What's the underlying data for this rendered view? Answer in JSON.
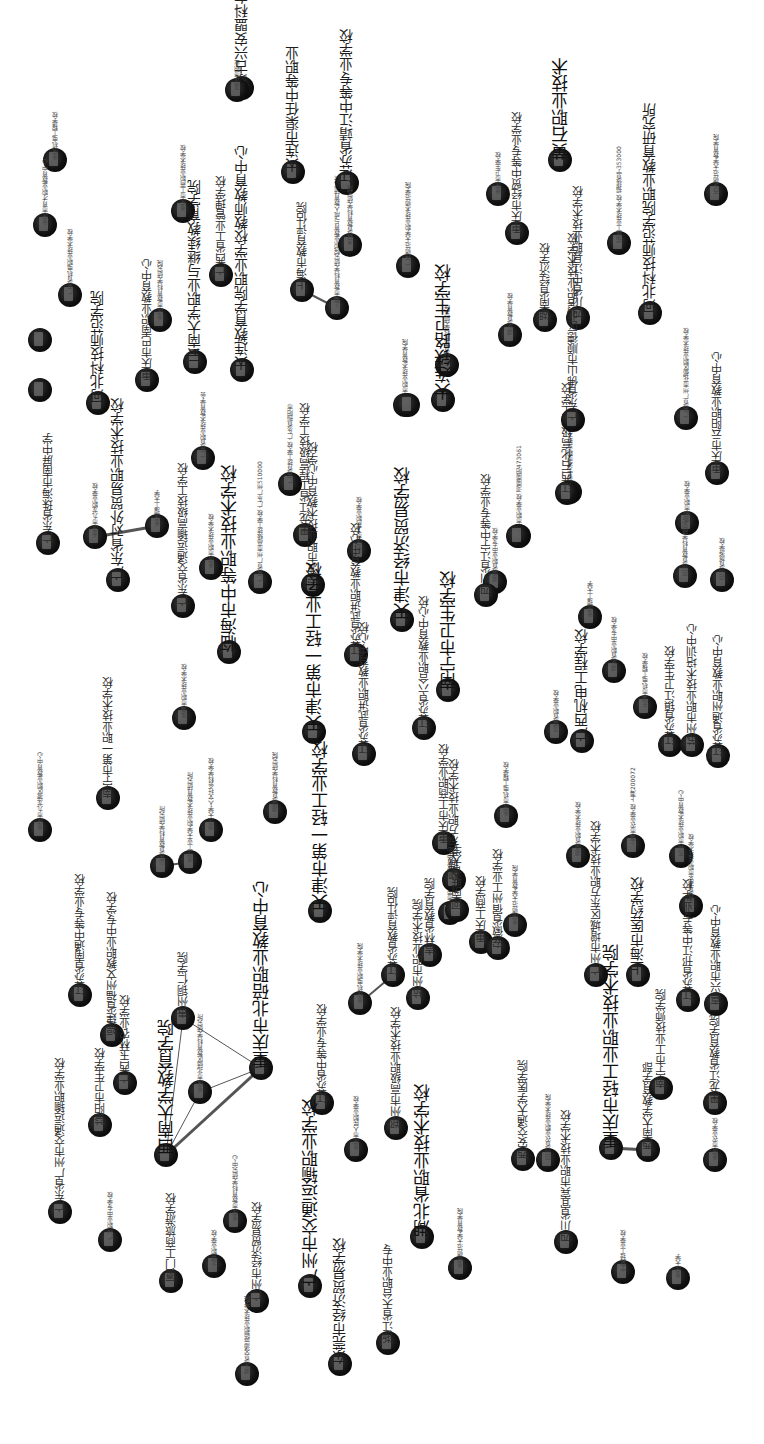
{
  "diagram": {
    "type": "network-graph",
    "orientation": "rotated-90",
    "node_color": "#111111",
    "edge_color": "#555555",
    "background": "#ffffff"
  },
  "nodes": [
    {
      "id": "n1",
      "x": 55,
      "y": 160,
      "label": "重庆机电工程学校",
      "size": "s"
    },
    {
      "id": "n2",
      "x": 45,
      "y": 225,
      "label": "重庆市育才职业教育中心",
      "size": "s"
    },
    {
      "id": "n3",
      "x": 70,
      "y": 295,
      "label": "广东省机电职业技术学校",
      "size": "s"
    },
    {
      "id": "n4",
      "x": 40,
      "y": 340,
      "label": "",
      "size": "s"
    },
    {
      "id": "n5",
      "x": 40,
      "y": 390,
      "label": "",
      "size": "s"
    },
    {
      "id": "n6",
      "x": 98,
      "y": 403,
      "label": "河北科技师范学院",
      "size": "l"
    },
    {
      "id": "n7",
      "x": 147,
      "y": 380,
      "label": "重庆市巴南职业教育中心",
      "size": "m"
    },
    {
      "id": "n8",
      "x": 160,
      "y": 320,
      "label": "重庆市教育科学研究院",
      "size": "s"
    },
    {
      "id": "n9",
      "x": 183,
      "y": 211,
      "label": "重庆市工商职业技术学校",
      "size": "s"
    },
    {
      "id": "n10",
      "x": 195,
      "y": 362,
      "label": "云南大学职业与继续教育学院",
      "size": "l"
    },
    {
      "id": "n11",
      "x": 221,
      "y": 275,
      "label": "广西省工业管理学校",
      "size": "m"
    },
    {
      "id": "n12",
      "x": 242,
      "y": 88,
      "label": "蒙古兴安盟科右前旗民族职业高中",
      "size": "l"
    },
    {
      "id": "n13",
      "x": 242,
      "y": 370,
      "label": "大连教育学院职业学校教师教育中心",
      "size": "l"
    },
    {
      "id": "n14",
      "x": 237,
      "y": 90,
      "label": "湛江市职业",
      "size": "s"
    },
    {
      "id": "n15",
      "x": 293,
      "y": 172,
      "label": "大连市渠任中等职业",
      "size": "l"
    },
    {
      "id": "n16",
      "x": 302,
      "y": 290,
      "label": "上海市教育评估院",
      "size": "m"
    },
    {
      "id": "n17",
      "x": 337,
      "y": 308,
      "label": "上海市教育科学研究院职业教育与成人教育研究所",
      "size": "s"
    },
    {
      "id": "n18",
      "x": 347,
      "y": 183,
      "label": "江苏省靖江中等专业学校",
      "size": "l"
    },
    {
      "id": "n19",
      "x": 350,
      "y": 245,
      "label": "吉林省教育科学研究院",
      "size": "s"
    },
    {
      "id": "n20",
      "x": 408,
      "y": 266,
      "label": "广西师范大学职业技术师范学院",
      "size": "s"
    },
    {
      "id": "n21",
      "x": 498,
      "y": 194,
      "label": "重庆市卫生学校",
      "size": "s"
    },
    {
      "id": "n22",
      "x": 517,
      "y": 233,
      "label": "重庆市经贸中等专业学校",
      "size": "m"
    },
    {
      "id": "n23",
      "x": 560,
      "y": 160,
      "label": "黄石职业技术",
      "size": "xl"
    },
    {
      "id": "n24",
      "x": 619,
      "y": 243,
      "label": "福建工业技术学校 福建省宁353000",
      "size": "s"
    },
    {
      "id": "n25",
      "x": 716,
      "y": 194,
      "label": "西北师范大学教育学院",
      "size": "s"
    },
    {
      "id": "n26",
      "x": 650,
      "y": 313,
      "label": "河北科技师范学院职业教育研究所",
      "size": "l"
    },
    {
      "id": "n27",
      "x": 510,
      "y": 335,
      "label": "湖北省教育学校",
      "size": "s"
    },
    {
      "id": "n28",
      "x": 545,
      "y": 320,
      "label": "湖南省经济学校",
      "size": "m"
    },
    {
      "id": "n29",
      "x": 578,
      "y": 318,
      "label": "四川省中江县职业技术学校",
      "size": "m"
    },
    {
      "id": "n30",
      "x": 447,
      "y": 365,
      "label": "吉林省教育科学研究院",
      "size": "s"
    },
    {
      "id": "n31",
      "x": 443,
      "y": 400,
      "label": "大连铁路卫生学校",
      "size": "xl"
    },
    {
      "id": "n32",
      "x": 405,
      "y": 405,
      "label": "重庆市职业技术教育学院",
      "size": "s"
    },
    {
      "id": "n33",
      "x": 48,
      "y": 543,
      "label": "广东省珠海市南屏中学",
      "size": "m"
    },
    {
      "id": "n34",
      "x": 95,
      "y": 537,
      "label": "重庆市九龙职业学校",
      "size": "s"
    },
    {
      "id": "n35",
      "x": 157,
      "y": 526,
      "label": "重庆理工大学",
      "size": "s"
    },
    {
      "id": "n36",
      "x": 118,
      "y": 580,
      "label": "广东省对外贸易职业技术学校",
      "size": "l"
    },
    {
      "id": "n37",
      "x": 183,
      "y": 606,
      "label": "广东省交通运输高级技工学校",
      "size": "m"
    },
    {
      "id": "n38",
      "x": 203,
      "y": 458,
      "label": "广东省职业技术教育学会",
      "size": "s"
    },
    {
      "id": "n39",
      "x": 211,
      "y": 568,
      "label": "重庆市职业技术学校",
      "size": "s"
    },
    {
      "id": "n40",
      "x": 229,
      "y": 652,
      "label": "临海市中等职业技术学校",
      "size": "xl"
    },
    {
      "id": "n41",
      "x": 260,
      "y": 582,
      "label": "广东省广州市高级技工学校 广东广州510000",
      "size": "s"
    },
    {
      "id": "n42",
      "x": 290,
      "y": 484,
      "label": "广东省技工学校 广东省揭阳市",
      "size": "s"
    },
    {
      "id": "n43",
      "x": 305,
      "y": 535,
      "label": "黑龙江省工程高级技工学校",
      "size": "m"
    },
    {
      "id": "n44",
      "x": 313,
      "y": 585,
      "label": "宁波市职业技术教育中心学校",
      "size": "m"
    },
    {
      "id": "n45",
      "x": 359,
      "y": 551,
      "label": "重庆市工商职业学校",
      "size": "s"
    },
    {
      "id": "n46",
      "x": 356,
      "y": 655,
      "label": "江苏省武进职业教育中心校",
      "size": "m"
    },
    {
      "id": "n47",
      "x": 402,
      "y": 620,
      "label": "天津市经济贸易学校",
      "size": "xl"
    },
    {
      "id": "n48",
      "x": 408,
      "y": 405,
      "label": "",
      "size": "s"
    },
    {
      "id": "n49",
      "x": 519,
      "y": 536,
      "label": "南宁市职业学校 河南南阳473061",
      "size": "s"
    },
    {
      "id": "n50",
      "x": 518,
      "y": 536,
      "label": "",
      "size": "s"
    },
    {
      "id": "n51",
      "x": 495,
      "y": 582,
      "label": "湖南省职业中专学校",
      "size": "s"
    },
    {
      "id": "n52",
      "x": 570,
      "y": 492,
      "label": "浙江省宁波市职业技术教育中心",
      "size": "s"
    },
    {
      "id": "n53",
      "x": 567,
      "y": 493,
      "label": "江西石化高级技工学校",
      "size": "m"
    },
    {
      "id": "n54",
      "x": 573,
      "y": 420,
      "label": "广东省佛山市顺德区北滘职业技术学校",
      "size": "m"
    },
    {
      "id": "n55",
      "x": 687,
      "y": 523,
      "label": "成都市职业学校",
      "size": "s"
    },
    {
      "id": "n56",
      "x": 685,
      "y": 576,
      "label": "四川省教育科学研究所",
      "size": "s"
    },
    {
      "id": "n57",
      "x": 686,
      "y": 418,
      "label": "广东省广州市花都区职业技术学校",
      "size": "s"
    },
    {
      "id": "n58",
      "x": 717,
      "y": 473,
      "label": "重庆市云阳职业教育中心",
      "size": "m"
    },
    {
      "id": "n59",
      "x": 722,
      "y": 580,
      "label": "四川省旅游学校",
      "size": "s"
    },
    {
      "id": "n60",
      "x": 486,
      "y": 595,
      "label": "四川省江宁中等专业学校",
      "size": "m"
    },
    {
      "id": "n61",
      "x": 448,
      "y": 690,
      "label": "南宁市卫生学校",
      "size": "xl"
    },
    {
      "id": "n62",
      "x": 424,
      "y": 728,
      "label": "江苏省六合职业教育中心校",
      "size": "m"
    },
    {
      "id": "n63",
      "x": 590,
      "y": 617,
      "label": "重庆理工大学",
      "size": "s"
    },
    {
      "id": "n64",
      "x": 614,
      "y": 671,
      "label": "湖北省职业中专学校",
      "size": "s"
    },
    {
      "id": "n65",
      "x": 645,
      "y": 707,
      "label": "天津市机电工程学校",
      "size": "s"
    },
    {
      "id": "n66",
      "x": 556,
      "y": 732,
      "label": "河南省职业学校",
      "size": "s"
    },
    {
      "id": "n67",
      "x": 582,
      "y": 741,
      "label": "广西机电工程学校",
      "size": "l"
    },
    {
      "id": "n68",
      "x": 670,
      "y": 745,
      "label": "江苏省镇江卫生学校",
      "size": "m"
    },
    {
      "id": "n69",
      "x": 692,
      "y": 745,
      "label": "苏州市职业技术培训中心",
      "size": "m"
    },
    {
      "id": "n70",
      "x": 718,
      "y": 756,
      "label": "江苏省通州职业教育中心",
      "size": "m"
    },
    {
      "id": "n71",
      "x": 40,
      "y": 830,
      "label": "重庆市九龙坡区职业教育中心",
      "size": "s"
    },
    {
      "id": "n72",
      "x": 108,
      "y": 798,
      "label": "南宁市第一职业技术学校",
      "size": "m"
    },
    {
      "id": "n73",
      "x": 184,
      "y": 718,
      "label": "珠海市职业技术学校",
      "size": "s"
    },
    {
      "id": "n74",
      "x": 211,
      "y": 830,
      "label": "浙江大学人文社会科学学校",
      "size": "s"
    },
    {
      "id": "n75",
      "x": 162,
      "y": 866,
      "label": "山东省教育科学研究所",
      "size": "s"
    },
    {
      "id": "n76",
      "x": 190,
      "y": 862,
      "label": "浙江工业大学职业技术教育研究所",
      "size": "s"
    },
    {
      "id": "n77",
      "x": 275,
      "y": 812,
      "label": "湖南省教育科学研究院",
      "size": "s"
    },
    {
      "id": "n78",
      "x": 314,
      "y": 732,
      "label": "天津市第一轻工业学校",
      "size": "xl"
    },
    {
      "id": "n79",
      "x": 364,
      "y": 754,
      "label": "江苏省武进职业教育中心校",
      "size": "m"
    },
    {
      "id": "n80",
      "x": 444,
      "y": 843,
      "label": "重庆市工商职业学校",
      "size": "m"
    },
    {
      "id": "n81",
      "x": 506,
      "y": 816,
      "label": "重庆市机电工程学校",
      "size": "s"
    },
    {
      "id": "n82",
      "x": 578,
      "y": 856,
      "label": "湖南省职业技术学校",
      "size": "s"
    },
    {
      "id": "n83",
      "x": 633,
      "y": 846,
      "label": "上海市农业学校 上海200072",
      "size": "s"
    },
    {
      "id": "n84",
      "x": 681,
      "y": 856,
      "label": "苏州市职业技术教育中心",
      "size": "s"
    },
    {
      "id": "n85",
      "x": 691,
      "y": 906,
      "label": "江苏省淮安市职业技术学校",
      "size": "s"
    },
    {
      "id": "n86",
      "x": 80,
      "y": 995,
      "label": "江苏省南通中等专业学校",
      "size": "m"
    },
    {
      "id": "n87",
      "x": 112,
      "y": 1035,
      "label": "福建省福州文教职业中专学校",
      "size": "m"
    },
    {
      "id": "n88",
      "x": 183,
      "y": 1018,
      "label": "贵州铜仁学院",
      "size": "m"
    },
    {
      "id": "n89",
      "x": 261,
      "y": 1068,
      "label": "重庆市北碚职业教育中心",
      "size": "xl"
    },
    {
      "id": "n90",
      "x": 320,
      "y": 911,
      "label": "天津市第一轻工业学校",
      "size": "xl"
    },
    {
      "id": "n91",
      "x": 360,
      "y": 1003,
      "label": "重庆机电职业技术学院",
      "size": "s"
    },
    {
      "id": "n92",
      "x": 393,
      "y": 975,
      "label": "江苏省教育评估院",
      "size": "m"
    },
    {
      "id": "n93",
      "x": 450,
      "y": 913,
      "label": "重庆市荣昌职业教育中心",
      "size": "s"
    },
    {
      "id": "n94",
      "x": 454,
      "y": 880,
      "label": "聊城市东方职业技术学校",
      "size": "m"
    },
    {
      "id": "n95",
      "x": 457,
      "y": 910,
      "label": "河南联合大学",
      "size": "m"
    },
    {
      "id": "n96",
      "x": 481,
      "y": 942,
      "label": "重庆工商学校",
      "size": "m"
    },
    {
      "id": "n97",
      "x": 498,
      "y": 948,
      "label": "安徽省宿州工业学校",
      "size": "m"
    },
    {
      "id": "n98",
      "x": 515,
      "y": 925,
      "label": "重庆师范大学教育学院",
      "size": "s"
    },
    {
      "id": "n99",
      "x": 430,
      "y": 955,
      "label": "吉林省教育学院",
      "size": "m"
    },
    {
      "id": "n100",
      "x": 418,
      "y": 998,
      "label": "杭州市职业技术学院",
      "size": "m"
    },
    {
      "id": "n101",
      "x": 596,
      "y": 975,
      "label": "广州市增城区东方职业技术学校",
      "size": "m"
    },
    {
      "id": "n102",
      "x": 638,
      "y": 975,
      "label": "上海市医药学校",
      "size": "l"
    },
    {
      "id": "n103",
      "x": 688,
      "y": 1000,
      "label": "江苏省邗江中等专业学校",
      "size": "m"
    },
    {
      "id": "n104",
      "x": 716,
      "y": 1004,
      "label": "嘉兴市职业教育中心",
      "size": "m"
    },
    {
      "id": "n105",
      "x": 100,
      "y": 1125,
      "label": "益阳市卫生学校",
      "size": "m"
    },
    {
      "id": "n106",
      "x": 125,
      "y": 1083,
      "label": "广西玉林农业学校",
      "size": "m"
    },
    {
      "id": "n107",
      "x": 166,
      "y": 1155,
      "label": "西南大学教育学院",
      "size": "xl"
    },
    {
      "id": "n108",
      "x": 200,
      "y": 1092,
      "label": "重庆市北碚区教育科学研究所",
      "size": "s"
    },
    {
      "id": "n109",
      "x": 322,
      "y": 1103,
      "label": "江苏省中等专业学校",
      "size": "m"
    },
    {
      "id": "n110",
      "x": 356,
      "y": 1150,
      "label": "重庆市人民职业学校",
      "size": "s"
    },
    {
      "id": "n111",
      "x": 396,
      "y": 1128,
      "label": "郑州市高级职业技术学校",
      "size": "m"
    },
    {
      "id": "n112",
      "x": 422,
      "y": 1237,
      "label": "湖北省职业技术学校",
      "size": "xl"
    },
    {
      "id": "n113",
      "x": 60,
      "y": 1212,
      "label": "广东省广州市交通运输职业学校",
      "size": "m"
    },
    {
      "id": "n114",
      "x": 110,
      "y": 1240,
      "label": "广州职业中专学校",
      "size": "s"
    },
    {
      "id": "n115",
      "x": 171,
      "y": 1281,
      "label": "厦门工商旅游学校",
      "size": "m"
    },
    {
      "id": "n116",
      "x": 214,
      "y": 1266,
      "label": "北京职业学校",
      "size": "s"
    },
    {
      "id": "n117",
      "x": 235,
      "y": 1221,
      "label": "重庆市教育科学研究中心",
      "size": "s"
    },
    {
      "id": "n118",
      "x": 257,
      "y": 1301,
      "label": "广州市经济贸易学校",
      "size": "m"
    },
    {
      "id": "n119",
      "x": 247,
      "y": 1374,
      "label": "湖北省交通运输职业技术学院",
      "size": "s"
    },
    {
      "id": "n120",
      "x": 310,
      "y": 1286,
      "label": "广州市交通运输职业学校",
      "size": "xl"
    },
    {
      "id": "n121",
      "x": 340,
      "y": 1364,
      "label": "东莞市经济贸易学校",
      "size": "l"
    },
    {
      "id": "n122",
      "x": 388,
      "y": 1343,
      "label": "浙江省天台职业中专",
      "size": "m"
    },
    {
      "id": "n123",
      "x": 460,
      "y": 1268,
      "label": "重庆师范大学教育学院",
      "size": "s"
    },
    {
      "id": "n124",
      "x": 523,
      "y": 1159,
      "label": "西安交通大学医学院",
      "size": "m"
    },
    {
      "id": "n125",
      "x": 548,
      "y": 1160,
      "label": "四川省农业职业技术学院",
      "size": "s"
    },
    {
      "id": "n126",
      "x": 566,
      "y": 1242,
      "label": "四川省宜宾市职业技术学校",
      "size": "m"
    },
    {
      "id": "n127",
      "x": 611,
      "y": 1148,
      "label": "重庆市轻工业职业技术学院",
      "size": "xl"
    },
    {
      "id": "n128",
      "x": 648,
      "y": 1150,
      "label": "西南大学教育学部",
      "size": "m"
    },
    {
      "id": "n129",
      "x": 661,
      "y": 1088,
      "label": "南宁市工业技师学院",
      "size": "m"
    },
    {
      "id": "n130",
      "x": 715,
      "y": 1103,
      "label": "黑龙江省教育学院",
      "size": "m"
    },
    {
      "id": "n131",
      "x": 715,
      "y": 1160,
      "label": "重庆市农业学校",
      "size": "s"
    },
    {
      "id": "n132",
      "x": 623,
      "y": 1272,
      "label": "宁夏轻工业学校",
      "size": "s"
    },
    {
      "id": "n133",
      "x": 678,
      "y": 1278,
      "label": "重庆大学",
      "size": "s"
    }
  ],
  "edges": [
    {
      "from": "n16",
      "to": "n17",
      "weight": 2
    },
    {
      "from": "n34",
      "to": "n35",
      "weight": 3
    },
    {
      "from": "n75",
      "to": "n76",
      "weight": 2
    },
    {
      "from": "n107",
      "to": "n88",
      "weight": 1
    },
    {
      "from": "n107",
      "to": "n108",
      "weight": 1
    },
    {
      "from": "n107",
      "to": "n89",
      "weight": 3
    },
    {
      "from": "n108",
      "to": "n89",
      "weight": 1
    },
    {
      "from": "n88",
      "to": "n89",
      "weight": 1
    },
    {
      "from": "n91",
      "to": "n92",
      "weight": 2
    },
    {
      "from": "n127",
      "to": "n128",
      "weight": 3
    }
  ]
}
